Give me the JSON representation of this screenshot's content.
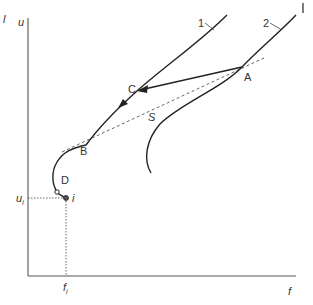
{
  "diagram": {
    "axes": {
      "y_label": "u",
      "x_label": "f",
      "corner_mark": "l"
    },
    "curves": [
      {
        "id": "1",
        "label": "1"
      },
      {
        "id": "2",
        "label": "2"
      }
    ],
    "line_s": {
      "label": "S"
    },
    "points": {
      "A": "A",
      "B": "B",
      "C": "C",
      "D": "D",
      "i": "i"
    },
    "reference": {
      "u_i": {
        "base": "u",
        "sub": "i"
      },
      "f_i": {
        "base": "f",
        "sub": "i"
      }
    },
    "colors": {
      "line": "#222222",
      "axis": "#555555",
      "text": "#333333"
    }
  }
}
